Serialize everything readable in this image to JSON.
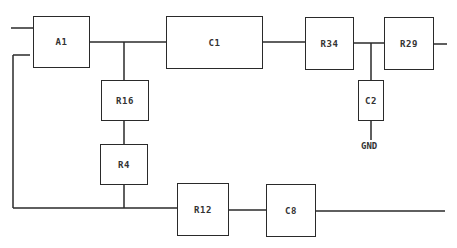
{
  "diagram": {
    "type": "block circuit diagram",
    "components": [
      {
        "id": "A1",
        "label": "A1"
      },
      {
        "id": "C1",
        "label": "C1"
      },
      {
        "id": "R34",
        "label": "R34"
      },
      {
        "id": "R29",
        "label": "R29"
      },
      {
        "id": "R16",
        "label": "R16"
      },
      {
        "id": "R4",
        "label": "R4"
      },
      {
        "id": "C2",
        "label": "C2"
      },
      {
        "id": "R12",
        "label": "R12"
      },
      {
        "id": "C8",
        "label": "C8"
      }
    ],
    "terminals": {
      "gnd": "GND"
    },
    "connections": [
      [
        "input-top",
        "A1"
      ],
      [
        "A1",
        "C1"
      ],
      [
        "A1-C1-node",
        "R16"
      ],
      [
        "R16",
        "R4"
      ],
      [
        "R4",
        "bottom-bus"
      ],
      [
        "C1",
        "R34"
      ],
      [
        "R34",
        "R29"
      ],
      [
        "R34-R29-node",
        "C2"
      ],
      [
        "C2",
        "GND"
      ],
      [
        "R29",
        "output-top"
      ],
      [
        "A1-left-return",
        "bottom-bus"
      ],
      [
        "bottom-bus",
        "R12"
      ],
      [
        "R12",
        "C8"
      ],
      [
        "C8",
        "output-bottom"
      ]
    ],
    "colors": {
      "line": "#2a2a2a",
      "background": "#ffffff"
    }
  }
}
